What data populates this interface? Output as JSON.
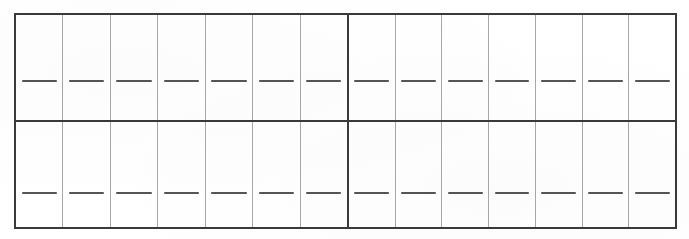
{
  "document": {
    "type": "blank-grid-form",
    "background_color": "#ffffff",
    "line_color": "#3a3a3a",
    "inner_line_color": "#a8a8a8",
    "dash_color": "#555555",
    "title": "",
    "columns_per_half": 7,
    "halves": 2,
    "total_columns": 14,
    "rows": 2,
    "total_cells": 28
  },
  "grid": {
    "rows": [
      {
        "name": "top-row",
        "halves": [
          {
            "name": "top-left-half",
            "cells": [
              {
                "name": "cell-r1-c1",
                "value": "",
                "dash": true
              },
              {
                "name": "cell-r1-c2",
                "value": "",
                "dash": true
              },
              {
                "name": "cell-r1-c3",
                "value": "",
                "dash": true
              },
              {
                "name": "cell-r1-c4",
                "value": "",
                "dash": true
              },
              {
                "name": "cell-r1-c5",
                "value": "",
                "dash": true
              },
              {
                "name": "cell-r1-c6",
                "value": "",
                "dash": true
              },
              {
                "name": "cell-r1-c7",
                "value": "",
                "dash": true
              }
            ]
          },
          {
            "name": "top-right-half",
            "cells": [
              {
                "name": "cell-r1-c8",
                "value": "",
                "dash": true
              },
              {
                "name": "cell-r1-c9",
                "value": "",
                "dash": true
              },
              {
                "name": "cell-r1-c10",
                "value": "",
                "dash": true
              },
              {
                "name": "cell-r1-c11",
                "value": "",
                "dash": true
              },
              {
                "name": "cell-r1-c12",
                "value": "",
                "dash": true
              },
              {
                "name": "cell-r1-c13",
                "value": "",
                "dash": true
              },
              {
                "name": "cell-r1-c14",
                "value": "",
                "dash": true
              }
            ]
          }
        ]
      },
      {
        "name": "bottom-row",
        "halves": [
          {
            "name": "bottom-left-half",
            "cells": [
              {
                "name": "cell-r2-c1",
                "value": "",
                "dash": true
              },
              {
                "name": "cell-r2-c2",
                "value": "",
                "dash": true
              },
              {
                "name": "cell-r2-c3",
                "value": "",
                "dash": true
              },
              {
                "name": "cell-r2-c4",
                "value": "",
                "dash": true
              },
              {
                "name": "cell-r2-c5",
                "value": "",
                "dash": true
              },
              {
                "name": "cell-r2-c6",
                "value": "",
                "dash": true
              },
              {
                "name": "cell-r2-c7",
                "value": "",
                "dash": true
              }
            ]
          },
          {
            "name": "bottom-right-half",
            "cells": [
              {
                "name": "cell-r2-c8",
                "value": "",
                "dash": true
              },
              {
                "name": "cell-r2-c9",
                "value": "",
                "dash": true
              },
              {
                "name": "cell-r2-c10",
                "value": "",
                "dash": true
              },
              {
                "name": "cell-r2-c11",
                "value": "",
                "dash": true
              },
              {
                "name": "cell-r2-c12",
                "value": "",
                "dash": true
              },
              {
                "name": "cell-r2-c13",
                "value": "",
                "dash": true
              },
              {
                "name": "cell-r2-c14",
                "value": "",
                "dash": true
              }
            ]
          }
        ]
      }
    ]
  },
  "geometry": {
    "frame_left": 14,
    "frame_top": 13,
    "frame_right": 677,
    "frame_bottom": 229,
    "row_divider_y": 120,
    "half_divider_x": 347,
    "column_width": 48,
    "top_dash_y": 80,
    "bottom_dash_y": 192
  }
}
